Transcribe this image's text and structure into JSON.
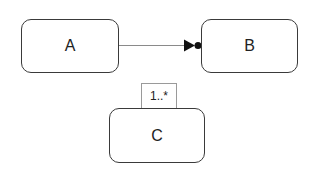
{
  "diagram": {
    "nodes": [
      {
        "id": "A",
        "label": "A"
      },
      {
        "id": "B",
        "label": "B"
      },
      {
        "id": "C",
        "label": "C"
      }
    ],
    "edges": [
      {
        "from": "A",
        "to": "B",
        "type": "directed",
        "head": "filled-triangle-with-dot"
      }
    ],
    "annotations": [
      {
        "attached_to": "C",
        "label": "1..*",
        "position": "top"
      }
    ],
    "colors": {
      "stroke": "#3a3a3a",
      "fill": "#ffffff",
      "text": "#222222"
    }
  }
}
